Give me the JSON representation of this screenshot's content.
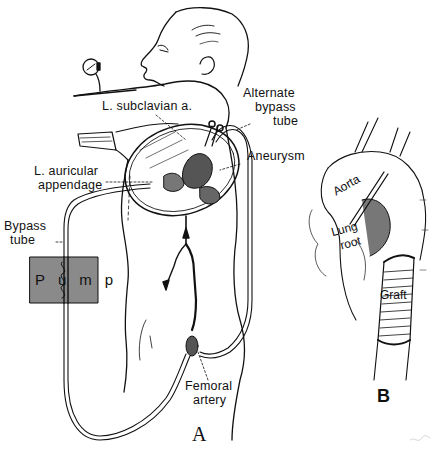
{
  "figure": {
    "panels": [
      {
        "id": "A",
        "label": "A",
        "description": "Patient in lateral position with thoracotomy; left atrial-femoral artery bypass via pump"
      },
      {
        "id": "B",
        "label": "B",
        "description": "Close-up of aortic graft replacement distal to aortic arch"
      }
    ],
    "panel_a": {
      "letter": "A",
      "labels": {
        "subclavian": "L. subclavian a.",
        "alternate_line1": "Alternate",
        "alternate_line2": "bypass",
        "alternate_line3": "tube",
        "auricular_line1": "L. auricular",
        "auricular_line2": "appendage",
        "aneurysm": "Aneurysm",
        "bypass_line1": "Bypass",
        "bypass_line2": "tube",
        "pump": "Pump",
        "femoral_line1": "Femoral",
        "femoral_line2": "artery"
      }
    },
    "panel_b": {
      "letter": "B",
      "labels": {
        "aorta": "Aorta",
        "lung_line1": "Lung",
        "lung_line2": "root",
        "graft": "Graft"
      }
    },
    "colors": {
      "ink": "#111111",
      "pump_fill": "#8a8a8a",
      "background": "#ffffff"
    }
  }
}
